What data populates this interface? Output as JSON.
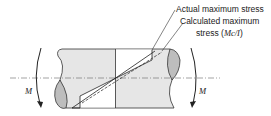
{
  "labels": {
    "actual": "Actual maximum stress",
    "calculated_line1": "Calculated maximum",
    "calculated_line2_prefix": "stress (",
    "calculated_formula": "Mc/I",
    "calculated_line2_suffix": ")",
    "moment_left": "M",
    "moment_right": "M"
  },
  "colors": {
    "body_fill": "#e6e6e6",
    "end_cap_fill": "#bdbdbd",
    "stroke": "#333333"
  }
}
